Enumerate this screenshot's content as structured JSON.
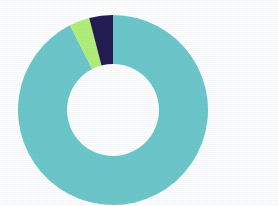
{
  "chart_data": {
    "type": "pie",
    "variant": "donut",
    "title": "",
    "subtitle": "",
    "xlabel": "",
    "ylabel": "",
    "grid": false,
    "legend": "none",
    "center_label": "",
    "background_color": "#ffffff",
    "geometry": {
      "center_x": 113,
      "center_y": 110,
      "outer_radius": 95,
      "inner_radius": 46,
      "start_angle_deg": 0,
      "direction": "clockwise"
    },
    "categories": [
      "Segment 1",
      "Segment 2",
      "Segment 3"
    ],
    "values": [
      92.5,
      3.5,
      4.0
    ],
    "colors": [
      "#6cc7cb",
      "#b2ef79",
      "#231d53"
    ],
    "slices": [
      {
        "label": "Segment 1",
        "value": 92.5,
        "percent": "92.5%",
        "color": "#6cc7cb",
        "start_angle_deg": 0,
        "end_angle_deg": 333,
        "color_name": "teal"
      },
      {
        "label": "Segment 2",
        "value": 3.5,
        "percent": "3.5%",
        "color": "#b2ef79",
        "start_angle_deg": 333,
        "end_angle_deg": 345.5,
        "color_name": "light-green"
      },
      {
        "label": "Segment 3",
        "value": 4.0,
        "percent": "4.0%",
        "color": "#231d53",
        "start_angle_deg": 345.5,
        "end_angle_deg": 360,
        "color_name": "dark-navy"
      }
    ]
  }
}
